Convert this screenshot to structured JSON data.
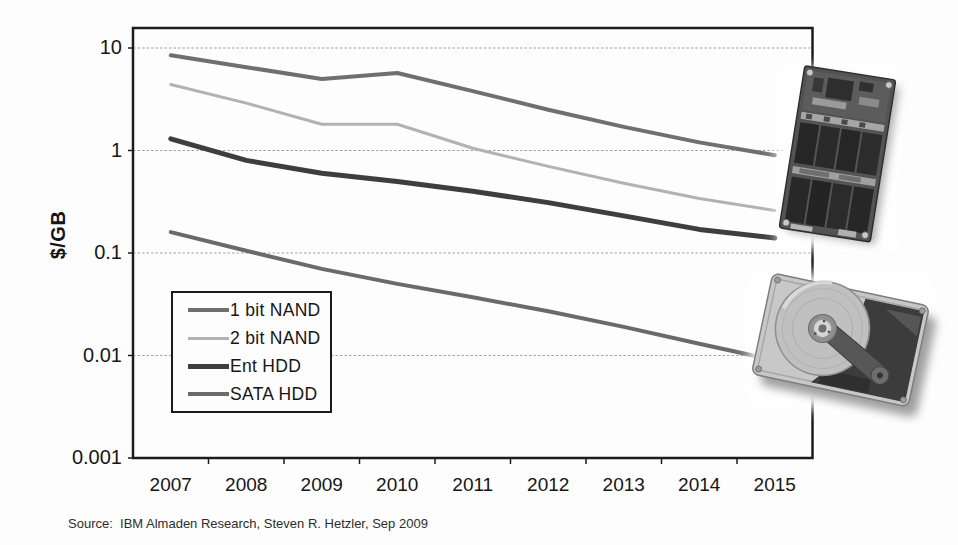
{
  "chart_data": {
    "type": "line",
    "title": "",
    "xlabel": "",
    "ylabel": "$/GB",
    "y_scale": "log",
    "ylim": [
      0.001,
      16
    ],
    "grid": "horizontal-only",
    "legend_position": "inside-left",
    "axis_color": "#1c1c1c",
    "grid_color": "#a2a2a2",
    "categories": [
      "2007",
      "2008",
      "2009",
      "2010",
      "2011",
      "2012",
      "2013",
      "2014",
      "2015"
    ],
    "y_ticks": [
      {
        "label": "10",
        "value": 10
      },
      {
        "label": "1",
        "value": 1
      },
      {
        "label": "0.1",
        "value": 0.1
      },
      {
        "label": "0.01",
        "value": 0.01
      },
      {
        "label": "0.001",
        "value": 0.001
      }
    ],
    "series": [
      {
        "name": "1 bit NAND",
        "color": "#6f6f6f",
        "width": 4,
        "values": [
          8.5,
          6.5,
          5.0,
          5.7,
          3.8,
          2.5,
          1.7,
          1.2,
          0.9
        ]
      },
      {
        "name": "2 bit NAND",
        "color": "#b2b2b2",
        "width": 3,
        "values": [
          4.4,
          2.9,
          1.8,
          1.8,
          1.05,
          0.7,
          0.48,
          0.34,
          0.26
        ]
      },
      {
        "name": "Ent HDD",
        "color": "#3e3e3e",
        "width": 5,
        "values": [
          1.3,
          0.8,
          0.6,
          0.5,
          0.4,
          0.31,
          0.23,
          0.17,
          0.14
        ]
      },
      {
        "name": "SATA HDD",
        "color": "#6a6a6a",
        "width": 4,
        "values": [
          0.16,
          0.105,
          0.07,
          0.05,
          0.037,
          0.027,
          0.019,
          0.013,
          0.009
        ]
      }
    ]
  },
  "y_axis_title": "$/GB",
  "source_note": "Source:  IBM Almaden Research, Steven R. Hetzler, Sep 2009",
  "photos": {
    "top_right": "ssd-flash-module-photo",
    "bottom_right": "open-hard-disk-drive-photo"
  }
}
